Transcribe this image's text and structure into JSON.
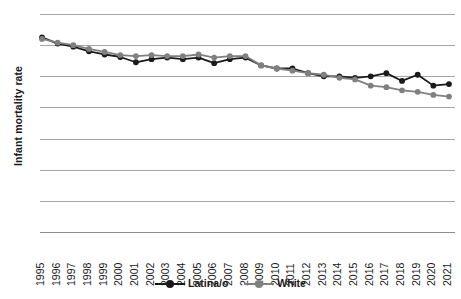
{
  "chart_data": {
    "type": "line",
    "title": "",
    "xlabel": "",
    "ylabel": "Infant mortality rate",
    "ylim": [
      0,
      7
    ],
    "yticks": [
      7,
      6,
      5,
      4,
      3,
      2,
      1,
      0
    ],
    "grid": true,
    "legend_position": "bottom-center",
    "markers": "circle",
    "categories": [
      "1995",
      "1996",
      "1997",
      "1998",
      "1999",
      "2000",
      "2001",
      "2002",
      "2003",
      "2004",
      "2005",
      "2006",
      "2007",
      "2008",
      "2009",
      "2010",
      "2011",
      "2012",
      "2013",
      "2014",
      "2015",
      "2016",
      "2017",
      "2018",
      "2019",
      "2020",
      "2021"
    ],
    "series": [
      {
        "name": "Latina/o",
        "color": "#1a1a1a",
        "values": [
          6.25,
          6.05,
          5.95,
          5.8,
          5.7,
          5.62,
          5.45,
          5.55,
          5.6,
          5.55,
          5.6,
          5.42,
          5.55,
          5.6,
          5.35,
          5.25,
          5.25,
          5.1,
          5.0,
          5.0,
          4.95,
          5.0,
          5.1,
          4.85,
          5.05,
          4.7,
          4.75
        ]
      },
      {
        "name": "White",
        "color": "#808080",
        "values": [
          6.2,
          6.08,
          6.0,
          5.88,
          5.78,
          5.68,
          5.65,
          5.68,
          5.65,
          5.65,
          5.7,
          5.6,
          5.65,
          5.65,
          5.35,
          5.25,
          5.18,
          5.1,
          5.05,
          4.95,
          4.9,
          4.7,
          4.65,
          4.55,
          4.5,
          4.4,
          4.35
        ]
      }
    ]
  }
}
